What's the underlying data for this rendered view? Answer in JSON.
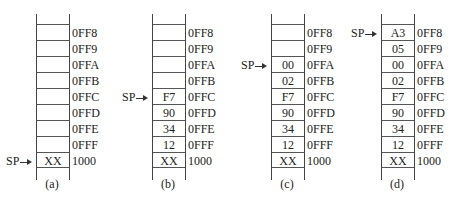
{
  "figure": {
    "addresses": [
      "0FF8",
      "0FF9",
      "0FFA",
      "0FFB",
      "0FFC",
      "0FFD",
      "0FFE",
      "0FFF",
      "1000"
    ],
    "sp_label": "SP",
    "panels": [
      {
        "caption": "(a)",
        "sp_row": 8,
        "cells": [
          "",
          "",
          "",
          "",
          "",
          "",
          "",
          "",
          "XX"
        ]
      },
      {
        "caption": "(b)",
        "sp_row": 4,
        "cells": [
          "",
          "",
          "",
          "",
          "F7",
          "90",
          "34",
          "12",
          "XX"
        ]
      },
      {
        "caption": "(c)",
        "sp_row": 2,
        "cells": [
          "",
          "",
          "00",
          "02",
          "F7",
          "90",
          "34",
          "12",
          "XX"
        ]
      },
      {
        "caption": "(d)",
        "sp_row": 0,
        "cells": [
          "A3",
          "05",
          "00",
          "02",
          "F7",
          "90",
          "34",
          "12",
          "XX"
        ]
      }
    ]
  }
}
